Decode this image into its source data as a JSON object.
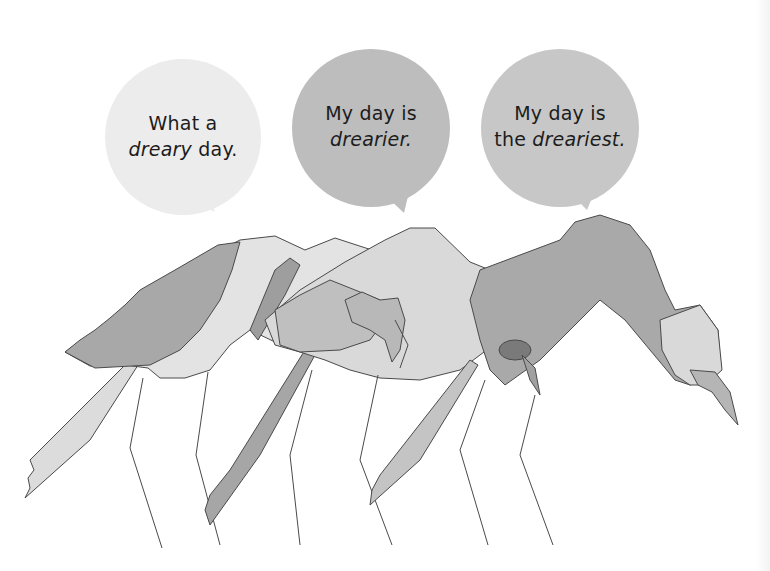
{
  "bubbles": [
    {
      "line1": "What a",
      "line2_pre": "",
      "line2_emph": "dreary",
      "line2_post": " day.",
      "fill": "#ececec"
    },
    {
      "line1": "My day is",
      "line2_pre": "",
      "line2_emph": "drearier.",
      "line2_post": "",
      "fill": "#bdbdbd"
    },
    {
      "line1": "My day is",
      "line2_pre": "the ",
      "line2_emph": "dreariest.",
      "line2_post": "",
      "fill": "#c7c7c7"
    }
  ],
  "illustration": {
    "subject": "three stooped watercolor flamingos in grayscale",
    "ink": "#4a4a4a",
    "shades": [
      "#e6e6e6",
      "#cfcfcf",
      "#b3b3b3",
      "#9a9a9a"
    ]
  }
}
